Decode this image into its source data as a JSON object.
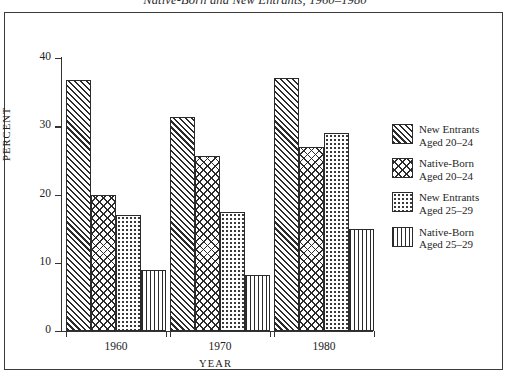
{
  "figure": {
    "title": "Native-Born and New Entrants, 1960–1980"
  },
  "chart_data": {
    "type": "bar",
    "title": "Native-Born and New Entrants, 1960–1980",
    "xlabel": "YEAR",
    "ylabel": "PERCENT",
    "categories": [
      "1960",
      "1970",
      "1980"
    ],
    "ylim": [
      0,
      40
    ],
    "yticks": [
      0,
      10,
      20,
      30,
      40
    ],
    "ytick_labels": [
      "0",
      "10",
      "20",
      "30",
      "40"
    ],
    "grid": false,
    "legend_position": "right",
    "series": [
      {
        "name": "New Entrants Aged 20-24",
        "label_line1": "New Entrants",
        "label_line2": "Aged 20–24",
        "pattern": "diagonal-hatch",
        "values": [
          36.8,
          31.3,
          37.0
        ]
      },
      {
        "name": "Native-Born Aged 20-24",
        "label_line1": "Native-Born",
        "label_line2": "Aged 20–24",
        "pattern": "cross-hatch",
        "values": [
          20.0,
          25.7,
          27.0
        ]
      },
      {
        "name": "New Entrants Aged 25-29",
        "label_line1": "New Entrants",
        "label_line2": "Aged 25–29",
        "pattern": "stipple-dots",
        "values": [
          17.0,
          17.4,
          29.0
        ]
      },
      {
        "name": "Native-Born Aged 25-29",
        "label_line1": "Native-Born",
        "label_line2": "Aged 25–29",
        "pattern": "vertical-lines",
        "values": [
          9.0,
          8.2,
          15.0
        ]
      }
    ]
  }
}
